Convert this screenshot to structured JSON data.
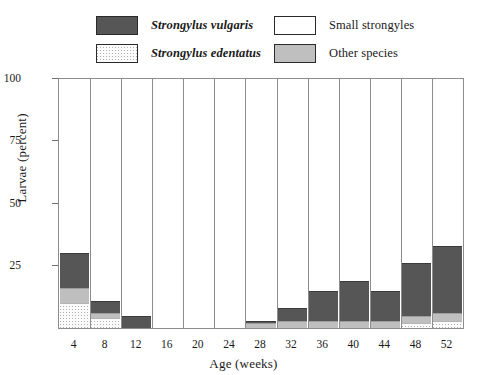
{
  "legend": {
    "items": [
      {
        "label": "Strongylus vulgaris",
        "key": "vulgaris",
        "style": "italic",
        "color": "#565656",
        "icon": "legend-swatch-vulgaris"
      },
      {
        "label": "Small strongyles",
        "key": "small",
        "style": "roman",
        "color": "#ffffff",
        "icon": "legend-swatch-small-strongyles"
      },
      {
        "label": "Strongylus edentatus",
        "key": "edentatus",
        "style": "italic",
        "color": "#fbfbfb",
        "icon": "legend-swatch-edentatus"
      },
      {
        "label": "Other species",
        "key": "other",
        "style": "roman",
        "color": "#bfbfbf",
        "icon": "legend-swatch-other-species"
      }
    ]
  },
  "chart_data": {
    "type": "bar",
    "stacked": true,
    "title": "",
    "xlabel": "Age (weeks)",
    "ylabel": "Larvae (percent)",
    "categories": [
      "4",
      "8",
      "12",
      "16",
      "20",
      "24",
      "28",
      "32",
      "36",
      "40",
      "44",
      "48",
      "52"
    ],
    "xtick_labels": [
      "4",
      "8",
      "12",
      "16",
      "20",
      "24",
      "28",
      "32",
      "36",
      "40",
      "44",
      "48",
      "52"
    ],
    "ytick_labels": [
      "100",
      "75",
      "50",
      "25"
    ],
    "yticks": [
      100,
      75,
      50,
      25
    ],
    "ylim": [
      0,
      100
    ],
    "grid": false,
    "legend_position": "above-plot",
    "series": [
      {
        "name": "Strongylus edentatus",
        "color": "#fbfbfb",
        "fill": "stipple",
        "values": [
          10,
          4,
          0,
          0,
          0,
          0,
          0,
          0,
          0,
          0,
          0,
          2,
          3
        ]
      },
      {
        "name": "Other species",
        "color": "#bfbfbf",
        "fill": "solid",
        "values": [
          6,
          2,
          0,
          0,
          0,
          0,
          2,
          3,
          3,
          3,
          3,
          3,
          3
        ]
      },
      {
        "name": "Strongylus vulgaris",
        "color": "#565656",
        "fill": "solid",
        "values": [
          14,
          5,
          5,
          0,
          0,
          0,
          1,
          5,
          12,
          16,
          12,
          21,
          27
        ]
      },
      {
        "name": "Small strongyles",
        "color": "#ffffff",
        "fill": "solid",
        "values": [
          70,
          89,
          95,
          0,
          100,
          100,
          97,
          92,
          85,
          81,
          85,
          74,
          67
        ]
      }
    ],
    "bar_totals_percent": [
      100,
      100,
      100,
      0,
      100,
      100,
      100,
      100,
      100,
      100,
      100,
      100,
      100
    ],
    "missing_categories": [
      "16"
    ]
  }
}
